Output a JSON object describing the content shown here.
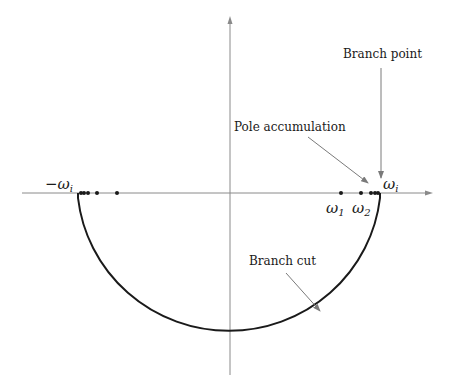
{
  "diagram": {
    "type": "complex-plane-contour",
    "labels": {
      "branch_point": "Branch point",
      "pole_accumulation": "Pole accumulation",
      "branch_cut": "Branch cut",
      "neg_omega_i": "−ω",
      "neg_omega_i_sub": "i",
      "omega_i": "ω",
      "omega_i_sub": "i",
      "omega_1": "ω",
      "omega_1_sub": "1",
      "omega_2": "ω",
      "omega_2_sub": "2"
    },
    "colors": {
      "axis": "#8a8a8a",
      "contour": "#1a1a1a",
      "pole": "#1a1a1a",
      "annotation_arrow": "#7a7a7a"
    },
    "poles_right_x": [
      341,
      361,
      371,
      375,
      378
    ],
    "poles_left_x": [
      117,
      97,
      88,
      84,
      81
    ]
  }
}
